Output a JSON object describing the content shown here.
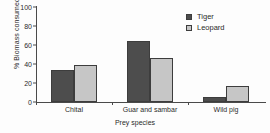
{
  "chart_data": {
    "type": "bar",
    "title": "",
    "xlabel": "Prey species",
    "ylabel": "% Biomass consumed",
    "categories": [
      "Chital",
      "Guar and sambar",
      "Wild pig"
    ],
    "series": [
      {
        "name": "Tiger",
        "color": "#4d4d4d",
        "values": [
          34,
          64,
          5
        ]
      },
      {
        "name": "Leopard",
        "color": "#c6c6c6",
        "values": [
          39,
          46,
          17
        ]
      }
    ],
    "ylim": [
      0,
      100
    ],
    "yticks": [
      0,
      20,
      40,
      60,
      80,
      100
    ],
    "ytick_labels": [
      "0",
      "20",
      "40",
      "60",
      "80",
      "100"
    ],
    "grid": false,
    "legend_position": "top-right"
  },
  "legend": {
    "items": [
      {
        "label": "Tiger"
      },
      {
        "label": "Leopard"
      }
    ]
  },
  "axes": {
    "y_title": "% Biomass consumed",
    "x_title": "Prey species"
  }
}
